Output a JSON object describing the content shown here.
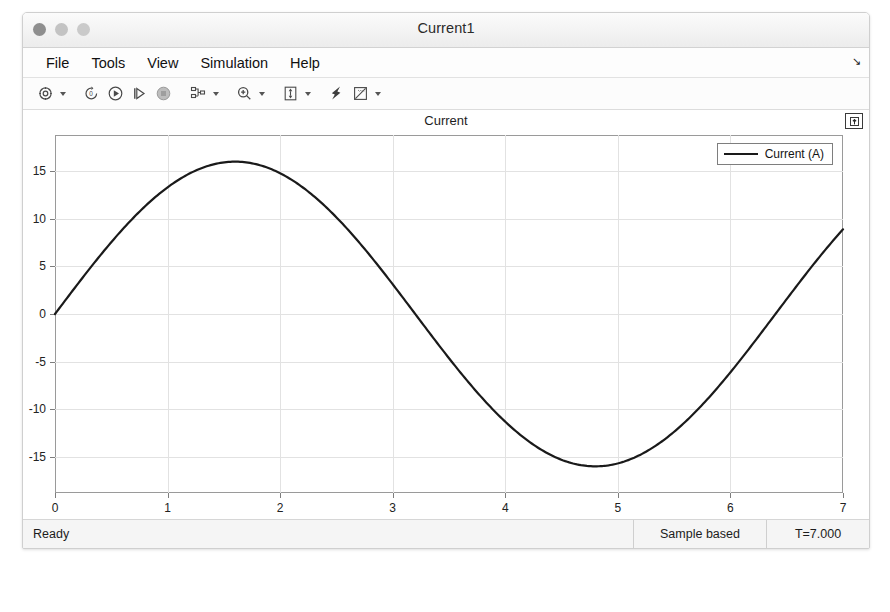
{
  "window": {
    "title": "Current1",
    "traffic_lights": [
      "close-button",
      "minimize-button",
      "zoom-button"
    ]
  },
  "menubar": {
    "items": [
      {
        "label": "File",
        "name": "menu-file"
      },
      {
        "label": "Tools",
        "name": "menu-tools"
      },
      {
        "label": "View",
        "name": "menu-view"
      },
      {
        "label": "Simulation",
        "name": "menu-simulation"
      },
      {
        "label": "Help",
        "name": "menu-help"
      }
    ],
    "overflow_glyph": "↘"
  },
  "toolbar": {
    "buttons": [
      {
        "name": "configuration-properties-icon",
        "icon": "gear",
        "has_caret": true
      },
      {
        "name": "run-back-to-start-icon",
        "icon": "rewind",
        "has_caret": false
      },
      {
        "name": "run-icon",
        "icon": "play",
        "has_caret": false
      },
      {
        "name": "step-forward-icon",
        "icon": "step",
        "has_caret": false
      },
      {
        "name": "stop-icon",
        "icon": "stop",
        "has_caret": false
      },
      {
        "name": "signal-selection-icon",
        "icon": "signals",
        "has_caret": true
      },
      {
        "name": "zoom-in-icon",
        "icon": "magnifier",
        "has_caret": true
      },
      {
        "name": "autoscale-icon",
        "icon": "autoscale",
        "has_caret": true
      },
      {
        "name": "cursor-measurements-icon",
        "icon": "cursor",
        "has_caret": false
      },
      {
        "name": "measurements-icon",
        "icon": "ruler",
        "has_caret": true
      }
    ]
  },
  "plot": {
    "title": "Current",
    "pin_button": "maximize-axes-icon",
    "legend": {
      "entries": [
        {
          "label": "Current (A)",
          "color": "#1a1a1a"
        }
      ]
    }
  },
  "statusbar": {
    "ready": "Ready",
    "mode": "Sample based",
    "time": "T=7.000"
  },
  "chart_data": {
    "type": "line",
    "title": "Current",
    "xlabel": "",
    "ylabel": "",
    "xlim": [
      0,
      7
    ],
    "ylim": [
      -18.8,
      18.8
    ],
    "xticks": [
      0,
      1,
      2,
      3,
      4,
      5,
      6,
      7
    ],
    "yticks": [
      15,
      10,
      5,
      0,
      -5,
      -10,
      -15
    ],
    "grid": true,
    "legend_position": "top-right",
    "series": [
      {
        "name": "Current (A)",
        "color": "#1a1a1a",
        "linewidth": 2.2,
        "description": "Sinusoid, amplitude 16 A, period 6.4 s, zero at t=0 rising",
        "amplitude": 16.0,
        "period": 6.4,
        "phase": 0.0,
        "x": [
          0.0,
          0.2,
          0.4,
          0.6,
          0.8,
          1.0,
          1.2,
          1.4,
          1.6,
          1.8,
          2.0,
          2.2,
          2.4,
          2.6,
          2.8,
          3.0,
          3.2,
          3.4,
          3.6,
          3.8,
          4.0,
          4.2,
          4.4,
          4.6,
          4.8,
          5.0,
          5.2,
          5.4,
          5.6,
          5.8,
          6.0,
          6.2,
          6.4,
          6.6,
          6.8,
          7.0
        ],
        "y": [
          0.0,
          3.12,
          6.12,
          8.88,
          11.31,
          13.32,
          14.78,
          15.69,
          16.0,
          15.69,
          14.78,
          13.32,
          11.31,
          8.88,
          6.12,
          3.12,
          0.0,
          -3.12,
          -6.12,
          -8.88,
          -11.31,
          -13.32,
          -14.78,
          -15.69,
          -16.0,
          -15.69,
          -14.78,
          -13.32,
          -11.31,
          -8.88,
          -6.12,
          -3.12,
          0.0,
          3.12,
          6.12,
          8.88
        ]
      }
    ]
  }
}
